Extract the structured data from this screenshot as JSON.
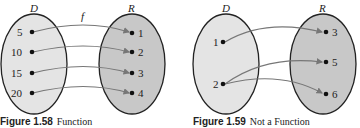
{
  "figures": [
    {
      "domain_label": "D",
      "range_label": "R",
      "map_label": "f",
      "domain_values": [
        "5",
        "10",
        "15",
        "20"
      ],
      "range_values": [
        "1",
        "2",
        "3",
        "4"
      ],
      "mappings": [
        [
          "5",
          "1"
        ],
        [
          "10",
          "2"
        ],
        [
          "15",
          "3"
        ],
        [
          "20",
          "4"
        ]
      ],
      "caption_number": "Figure 1.58",
      "caption_text": "Function"
    },
    {
      "domain_label": "D",
      "range_label": "R",
      "domain_values": [
        "1",
        "2"
      ],
      "range_values": [
        "3",
        "5",
        "6"
      ],
      "mappings": [
        [
          "1",
          "3"
        ],
        [
          "2",
          "5"
        ],
        [
          "2",
          "6"
        ]
      ],
      "caption_number": "Figure 1.59",
      "caption_text": "Not a Function"
    }
  ],
  "colors": {
    "domain_fill": "#e4e4e4",
    "range_fill": "#c8c8c8",
    "outline": "#222222",
    "arrow": "#777777"
  }
}
